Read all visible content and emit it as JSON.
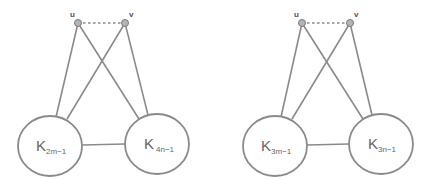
{
  "diagrams": [
    {
      "vertices": [
        {
          "label": "u",
          "x": 78,
          "y": 23
        },
        {
          "label": "v",
          "x": 125,
          "y": 23
        }
      ],
      "cliques": [
        {
          "base": "K",
          "sub": "2m−1",
          "cx": 50,
          "cy": 146,
          "rx": 32,
          "ry": 30
        },
        {
          "base": "K",
          "sub": "4n−1",
          "cx": 157,
          "cy": 144,
          "rx": 32,
          "ry": 30
        }
      ]
    },
    {
      "vertices": [
        {
          "label": "u",
          "x": 302,
          "y": 23
        },
        {
          "label": "v",
          "x": 350,
          "y": 23
        }
      ],
      "cliques": [
        {
          "base": "K",
          "sub": "3m−1",
          "cx": 275,
          "cy": 146,
          "rx": 32,
          "ry": 30
        },
        {
          "base": "K",
          "sub": "3n−1",
          "cx": 381,
          "cy": 144,
          "rx": 32,
          "ry": 30
        }
      ]
    }
  ],
  "colors": {
    "stroke": "#8a8a8a",
    "vertex_fill": "#b5b5b5",
    "text": "#666666"
  }
}
